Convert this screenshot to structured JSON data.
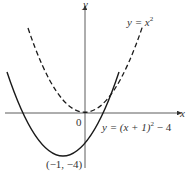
{
  "figure": {
    "type": "function-graph",
    "axes": {
      "x_label": "x",
      "y_label": "y",
      "origin_label": "0"
    },
    "curves": [
      {
        "name": "y = x^2",
        "label_prefix": "y = x",
        "label_exp": "2",
        "style": "dashed",
        "vertex": [
          0,
          0
        ]
      },
      {
        "name": "y = (x + 1)^2 - 4",
        "label_prefix": "y = (x + 1)",
        "label_exp": "2",
        "label_suffix": " − 4",
        "style": "solid",
        "vertex": [
          -1,
          -4
        ]
      }
    ],
    "vertex_label": "(−1, −4)",
    "colors": {
      "curve": "#1a1a1a",
      "axis": "#333333",
      "background": "#ffffff"
    }
  }
}
